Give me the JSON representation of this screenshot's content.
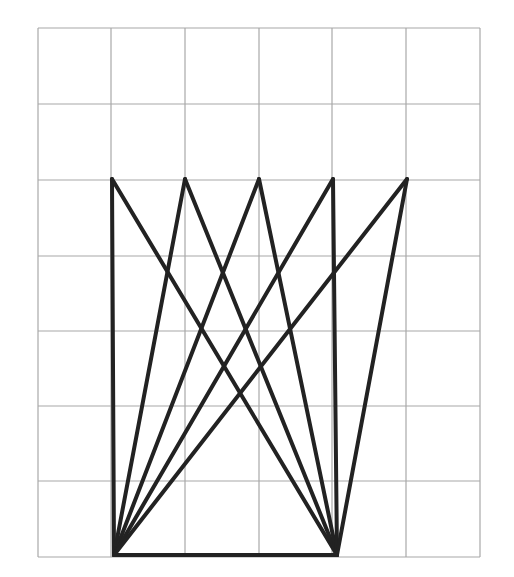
{
  "diagram": {
    "type": "geometry-grid-figure",
    "background": "#ffffff",
    "grid": {
      "color": "#a8a8a8",
      "stroke_width": 1.2,
      "columns": 6,
      "rows": 7,
      "x_lines": [
        38,
        111,
        185,
        259,
        332,
        406,
        480
      ],
      "y_lines": [
        28,
        104,
        180,
        256,
        331,
        406,
        481,
        557
      ]
    },
    "figure": {
      "color": "#222222",
      "stroke_width": 4,
      "top_points": [
        [
          112,
          179
        ],
        [
          185,
          179
        ],
        [
          259,
          179
        ],
        [
          333,
          179
        ],
        [
          407,
          179
        ]
      ],
      "bottom_points": [
        [
          114,
          555
        ],
        [
          337,
          555
        ]
      ],
      "segments": [
        [
          [
            114,
            555
          ],
          [
            112,
            179
          ]
        ],
        [
          [
            114,
            555
          ],
          [
            185,
            179
          ]
        ],
        [
          [
            114,
            555
          ],
          [
            259,
            179
          ]
        ],
        [
          [
            114,
            555
          ],
          [
            333,
            179
          ]
        ],
        [
          [
            114,
            555
          ],
          [
            407,
            179
          ]
        ],
        [
          [
            337,
            555
          ],
          [
            112,
            179
          ]
        ],
        [
          [
            337,
            555
          ],
          [
            185,
            179
          ]
        ],
        [
          [
            337,
            555
          ],
          [
            259,
            179
          ]
        ],
        [
          [
            337,
            555
          ],
          [
            333,
            179
          ]
        ],
        [
          [
            337,
            555
          ],
          [
            407,
            179
          ]
        ],
        [
          [
            114,
            555
          ],
          [
            337,
            555
          ]
        ]
      ]
    }
  }
}
